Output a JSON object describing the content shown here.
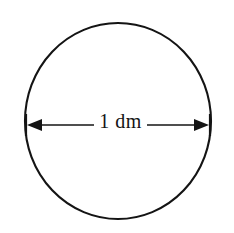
{
  "figure": {
    "kind": "geometry-diagram",
    "background_color": "#ffffff",
    "ink_color": "#141414"
  },
  "shape": {
    "name": "circle",
    "center_x": 118,
    "center_y": 121,
    "radius_x": 93,
    "radius_y": 98,
    "stroke_width": 2.1
  },
  "dimension": {
    "label": "1 dm",
    "value": "1",
    "unit": "dm",
    "measures": "diameter",
    "orientation": "horizontal",
    "line_y": 125,
    "start_x": 26,
    "end_x": 210,
    "gap_start_x": 94,
    "gap_end_x": 147,
    "arrowhead_length": 15,
    "arrowhead_half_height": 6,
    "tick_half_height": 11
  }
}
